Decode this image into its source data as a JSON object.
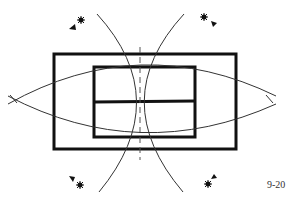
{
  "figure": {
    "label": "9-20",
    "stroke_color": "#111111",
    "background_color": "#ffffff"
  },
  "elements": {
    "outer_rectangle": "outer-rectangle",
    "inner_rectangle": "inner-rectangle",
    "inner_divider": "horizontal-bisector",
    "centerline": "dashed-vertical-centerline",
    "arcs": [
      "left-vertical-arc",
      "right-vertical-arc",
      "upper-horizontal-arc",
      "lower-horizontal-arc"
    ],
    "markers": [
      {
        "position": "top-left",
        "icon": "star-arrow-icon"
      },
      {
        "position": "top-right",
        "icon": "star-arrow-icon"
      },
      {
        "position": "bottom-left",
        "icon": "star-arrow-icon"
      },
      {
        "position": "bottom-right",
        "icon": "star-arrow-icon"
      }
    ]
  }
}
